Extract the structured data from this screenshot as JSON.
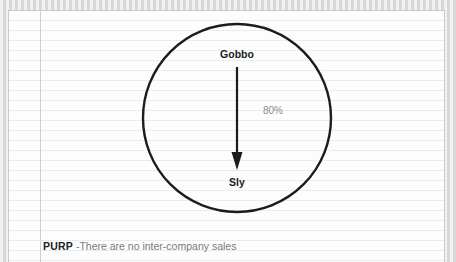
{
  "diagram": {
    "type": "ownership-structure",
    "group_boundary": {
      "shape": "circle",
      "label": ""
    },
    "nodes": [
      {
        "id": "gobbo",
        "label": "Gobbo"
      },
      {
        "id": "sly",
        "label": "Sly"
      }
    ],
    "edges": [
      {
        "from": "gobbo",
        "to": "sly",
        "label": "80%",
        "direction": "down",
        "arrowhead": "solid-triangle"
      }
    ]
  },
  "footer": {
    "code": "PURP",
    "separator": " -",
    "description": "There are no inter-company sales"
  },
  "colors": {
    "sheet_background": "#fdfdfd",
    "rule_line": "#e8eaec",
    "margin_rule": "#cfcfcf",
    "sheet_border": "#c9c9c9",
    "outer_background": "#e2e2e2",
    "stroke": "#1c1c1c",
    "node_text": "#1c1c1c",
    "edge_label_text": "#8d8d8d",
    "footer_code_text": "#1f1f1f",
    "footer_desc_text": "#7b7b7b"
  }
}
